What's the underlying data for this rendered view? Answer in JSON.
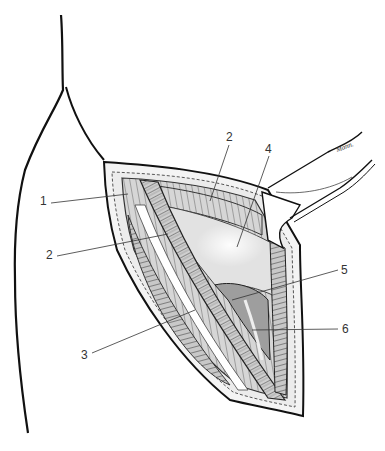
{
  "figure": {
    "type": "anatomical surgical illustration",
    "signature": "Mann.",
    "labels": [
      {
        "id": "1",
        "text": "1",
        "x": 40,
        "y": 200
      },
      {
        "id": "2a",
        "text": "2",
        "x": 229,
        "y": 131
      },
      {
        "id": "4",
        "text": "4",
        "x": 267,
        "y": 143
      },
      {
        "id": "2b",
        "text": "2",
        "x": 47,
        "y": 253
      },
      {
        "id": "5",
        "text": "5",
        "x": 340,
        "y": 266
      },
      {
        "id": "6",
        "text": "6",
        "x": 343,
        "y": 325
      },
      {
        "id": "3",
        "text": "3",
        "x": 82,
        "y": 355
      }
    ]
  }
}
